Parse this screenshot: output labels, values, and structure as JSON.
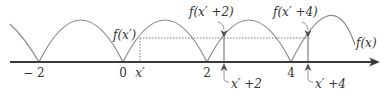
{
  "diagram": {
    "colors": {
      "curve": "#8a8a8a",
      "axis": "#3a3a3a",
      "guide": "#666666",
      "text": "#333333"
    },
    "axis": {
      "tick_labels": [
        "− 2",
        "0",
        "2",
        "4"
      ],
      "tick_values": [
        -2,
        0,
        2,
        4
      ]
    },
    "curve_label": "f(x)",
    "point_labels": {
      "x_prime": "x′",
      "f_x_prime": "f(x′)",
      "f_x_prime_plus_2": "f(x′ +2)",
      "f_x_prime_plus_4": "f(x′ +4)",
      "x_prime_plus_2": "x′ +2",
      "x_prime_plus_4": "x′ +4"
    },
    "period": 2,
    "icons": [
      "arrow-down-icon",
      "arrow-up-icon",
      "axis-arrow-icon"
    ]
  }
}
